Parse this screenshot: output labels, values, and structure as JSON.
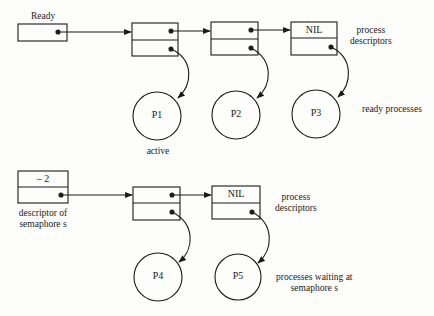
{
  "ready_queue": {
    "head_label": "Ready",
    "descriptors": [
      {
        "top": "",
        "next_pointer": true,
        "process_pointer": true
      },
      {
        "top": "",
        "next_pointer": true,
        "process_pointer": true
      },
      {
        "top": "NIL",
        "next_pointer": false,
        "process_pointer": true
      }
    ],
    "processes": [
      "P1",
      "P2",
      "P3"
    ],
    "active_label": "active",
    "descriptors_label": [
      "process",
      "descriptors"
    ],
    "processes_label": "ready processes"
  },
  "semaphore_queue": {
    "semaphore_value": "– 2",
    "semaphore_label": [
      "descriptor of",
      "semaphore s"
    ],
    "descriptors": [
      {
        "top": "",
        "next_pointer": true,
        "process_pointer": true
      },
      {
        "top": "NIL",
        "next_pointer": false,
        "process_pointer": true
      }
    ],
    "processes": [
      "P4",
      "P5"
    ],
    "descriptors_label": [
      "process",
      "descriptors"
    ],
    "processes_label": [
      "processes waiting at",
      "semaphore s"
    ]
  }
}
